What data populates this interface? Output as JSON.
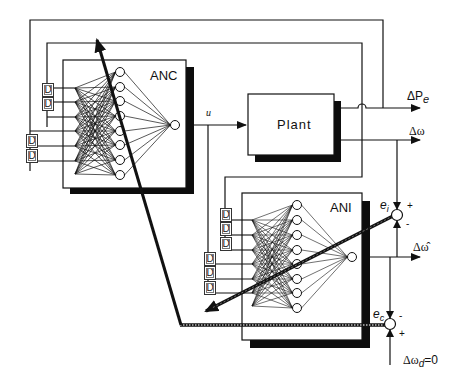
{
  "diagram": {
    "type": "neural adaptive control block diagram",
    "blocks": {
      "anc": {
        "label": "ANC"
      },
      "plant": {
        "label": "Plant"
      },
      "ani": {
        "label": "ANI"
      }
    },
    "delay_label": "D",
    "signals": {
      "u": "u",
      "delta_pe": "ΔP",
      "delta_pe_sub": "e",
      "delta_omega": "Δω",
      "delta_omega_hat": "Δω̂",
      "ei": "e",
      "ei_sub": "i",
      "ec": "e",
      "ec_sub": "c",
      "delta_omega_d": "Δω",
      "delta_omega_d_sub": "d",
      "delta_omega_d_value": "=0"
    },
    "summing_junction_signs": {
      "ei_top": "+",
      "ei_bottom": "-",
      "ec_top": "-",
      "ec_bottom": "+"
    },
    "colors": {
      "line": "#111111",
      "shadow": "#0d0d0d",
      "background": "#ffffff"
    }
  }
}
